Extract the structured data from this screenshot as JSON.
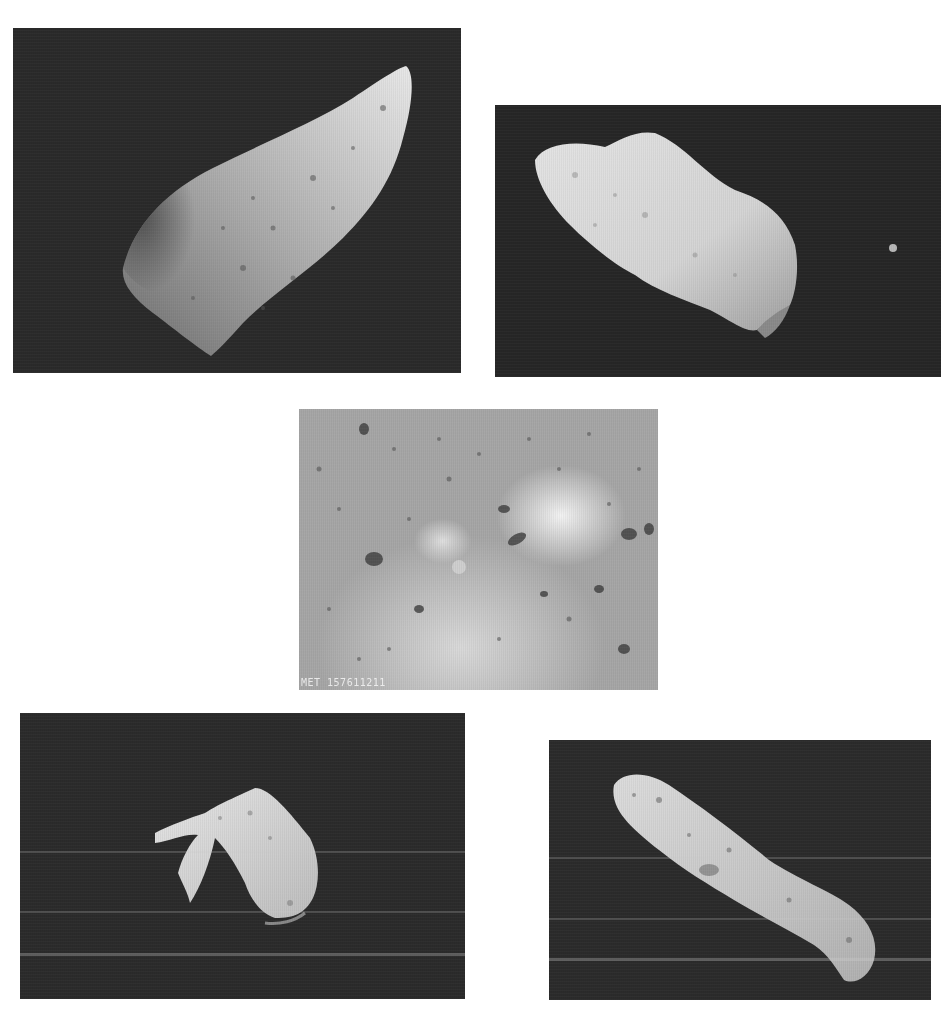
{
  "figure": {
    "layout": "five asteroid photographs arranged 2-1-2",
    "background": "#ffffff",
    "photos": [
      {
        "id": "top-left",
        "subject": "elongated wedge-shaped cratered asteroid",
        "tone": "grayscale",
        "bg": "#2a2a2a"
      },
      {
        "id": "top-right",
        "subject": "potato-shaped asteroid with small moon",
        "tone": "grayscale",
        "bg": "#262626"
      },
      {
        "id": "middle",
        "subject": "close-up of boulder-strewn regolith surface",
        "tone": "grayscale",
        "bg": "#a9a9a9",
        "label": "MET 157611211"
      },
      {
        "id": "bottom-left",
        "subject": "crescent-lit irregular asteroid",
        "tone": "grayscale",
        "bg": "#2b2b2b"
      },
      {
        "id": "bottom-right",
        "subject": "elongated peanut-shaped asteroid",
        "tone": "grayscale",
        "bg": "#2b2b2b"
      }
    ]
  }
}
